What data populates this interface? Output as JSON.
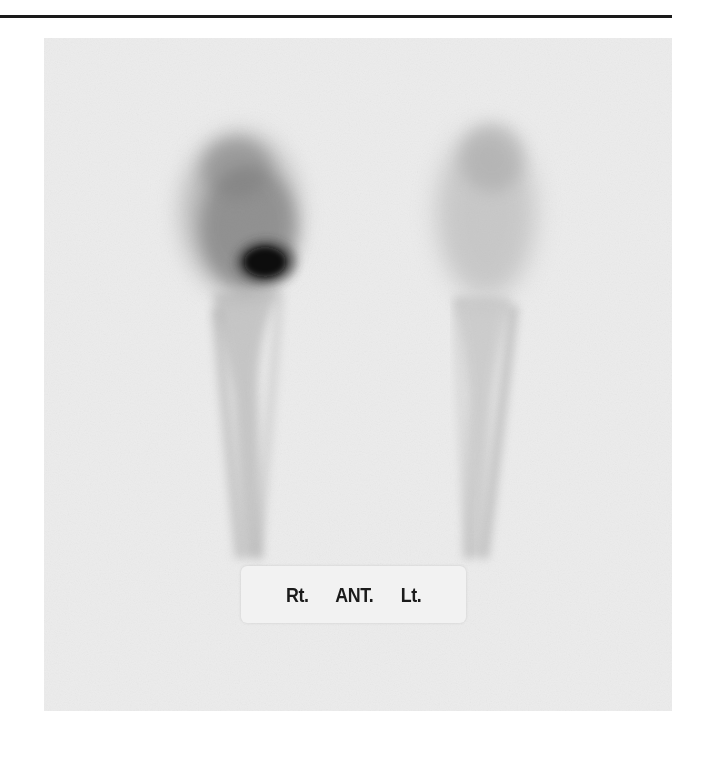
{
  "figure": {
    "type": "bone scintigraphy",
    "view_label": {
      "right": "Rt.",
      "view": "ANT.",
      "left": "Lt."
    },
    "colors": {
      "rule": "#1a1a1a",
      "panel_background": "#ececec",
      "uptake": "#3a3a3a",
      "hot_spot": "#0a0a0a",
      "label_background": "#f2f2f2"
    }
  }
}
